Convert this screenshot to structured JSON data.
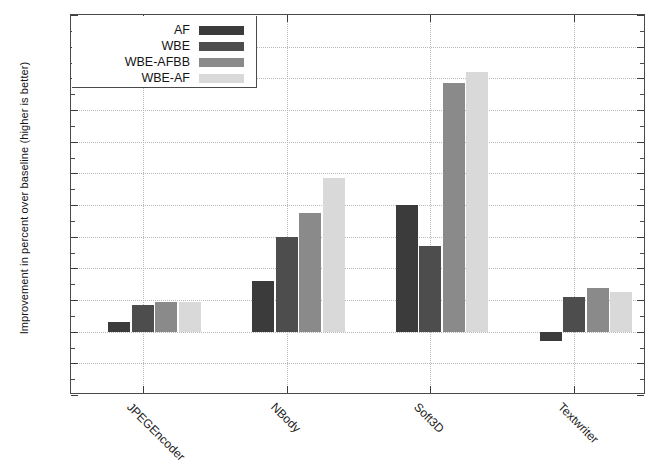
{
  "chart_data": {
    "type": "bar",
    "title": "",
    "xlabel": "",
    "ylabel": "Improvement in percent over baseline (higher is better)",
    "ylim": [
      -4,
      20
    ],
    "ytick_step": 2,
    "yticks": [
      20,
      18,
      16,
      14,
      12,
      10,
      8,
      6,
      4,
      2,
      0,
      -2,
      -4
    ],
    "ytick_labels": [
      "20",
      "18",
      "16",
      "14",
      "12",
      "10",
      "8",
      "6",
      "4",
      "2",
      "0",
      "-2",
      "-4"
    ],
    "grid": true,
    "legend_position": "top-left",
    "categories": [
      "JPEGEncoder",
      "NBody",
      "Soft3D",
      "Textwriter"
    ],
    "series": [
      {
        "name": "AF",
        "color": "#3b3b3b",
        "values": [
          0.6,
          3.2,
          8.0,
          -0.6
        ]
      },
      {
        "name": "WBE",
        "color": "#4d4d4d",
        "values": [
          1.7,
          6.0,
          5.4,
          2.2
        ]
      },
      {
        "name": "WBE-AFBB",
        "color": "#8a8a8a",
        "values": [
          1.85,
          7.5,
          15.7,
          2.75
        ]
      },
      {
        "name": "WBE-AF",
        "color": "#d9d9d9",
        "values": [
          1.85,
          9.7,
          16.4,
          2.5
        ]
      }
    ]
  },
  "legend": {
    "entries": [
      {
        "label": "AF"
      },
      {
        "label": "WBE"
      },
      {
        "label": "WBE-AFBB"
      },
      {
        "label": "WBE-AF"
      }
    ]
  }
}
